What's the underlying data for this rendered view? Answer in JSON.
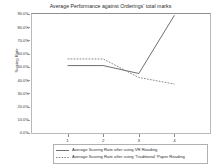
{
  "chart_data": {
    "type": "line",
    "title": "Average Performance against Orderings' total marks",
    "xlabel": "",
    "ylabel": "Scoring Rate",
    "categories": [
      "1",
      "2",
      "3",
      "4"
    ],
    "x": [
      1,
      2,
      3,
      4
    ],
    "ylim": [
      0,
      90
    ],
    "ytick_labels": [
      "90.0%",
      "80.0%",
      "70.0%",
      "60.0%",
      "50.0%",
      "40.0%",
      "30.0%",
      "20.0%",
      "10.0%",
      "0.0%"
    ],
    "ytick_values": [
      90,
      80,
      70,
      60,
      50,
      40,
      30,
      20,
      10,
      0
    ],
    "grid": false,
    "legend_position": "bottom",
    "series": [
      {
        "name": "Average Scoring Rate after using VR Reading",
        "style": "solid",
        "color": "#4a4a4a",
        "values": [
          51,
          51,
          45,
          89
        ]
      },
      {
        "name": "Average Scoring Rate after using 'Traditional' Paper Reading",
        "style": "dashed",
        "color": "#6b6b6b",
        "values": [
          56,
          56,
          42,
          37
        ]
      }
    ]
  },
  "legend": {
    "items": [
      {
        "label": "Average Scoring Rate after using VR Reading",
        "style": "solid"
      },
      {
        "label": "Average Scoring Rate after using 'Traditional' Paper Reading",
        "style": "dashed"
      }
    ]
  },
  "colors": {
    "background": "#ffffff",
    "frame": "#b9b9b9",
    "text": "#2f2f2f",
    "series_solid": "#4a4a4a",
    "series_dashed": "#6b6b6b"
  }
}
